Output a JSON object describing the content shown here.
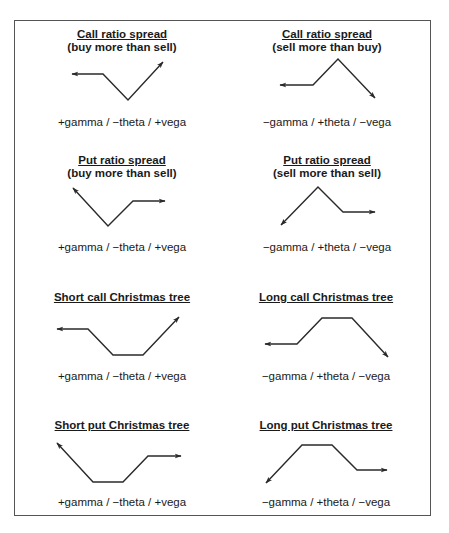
{
  "caption_partial": "",
  "panels": [
    {
      "title": "Call ratio spread",
      "subtitle": "(buy more than sell)",
      "greeks": "+gamma / −theta / +vega",
      "shape": "V with left flat arrow, right rising arrow"
    },
    {
      "title": "Call ratio spread",
      "subtitle": "(sell more than buy)",
      "greeks": "−gamma / +theta / −vega",
      "shape": "inverted V with left flat arrow, right falling arrow"
    },
    {
      "title": "Put ratio spread",
      "subtitle": "(buy more than sell)",
      "greeks": "+gamma / −theta / +vega",
      "shape": "V with left rising arrow, right flat arrow"
    },
    {
      "title": "Put ratio spread",
      "subtitle": "(sell more than sell)",
      "greeks": "−gamma / +theta / −vega",
      "shape": "inverted V with left falling arrow, right flat arrow"
    },
    {
      "title": "Short call Christmas tree",
      "subtitle": "",
      "greeks": "+gamma / −theta / +vega",
      "shape": "trough with left flat arrow, right rising arrow"
    },
    {
      "title": "Long call Christmas tree",
      "subtitle": "",
      "greeks": "−gamma / +theta / −vega",
      "shape": "plateau with left flat arrow, right falling arrow"
    },
    {
      "title": "Short put Christmas tree",
      "subtitle": "",
      "greeks": "+gamma / −theta / +vega",
      "shape": "trough with left rising arrow, right flat arrow"
    },
    {
      "title": "Long put Christmas tree",
      "subtitle": "",
      "greeks": "−gamma / +theta / −vega",
      "shape": "plateau with left falling arrow, right flat arrow"
    }
  ],
  "colors": {
    "line": "#2a2a2a",
    "frame": "#555555",
    "text": "#1a1a1a",
    "background": "#ffffff"
  }
}
